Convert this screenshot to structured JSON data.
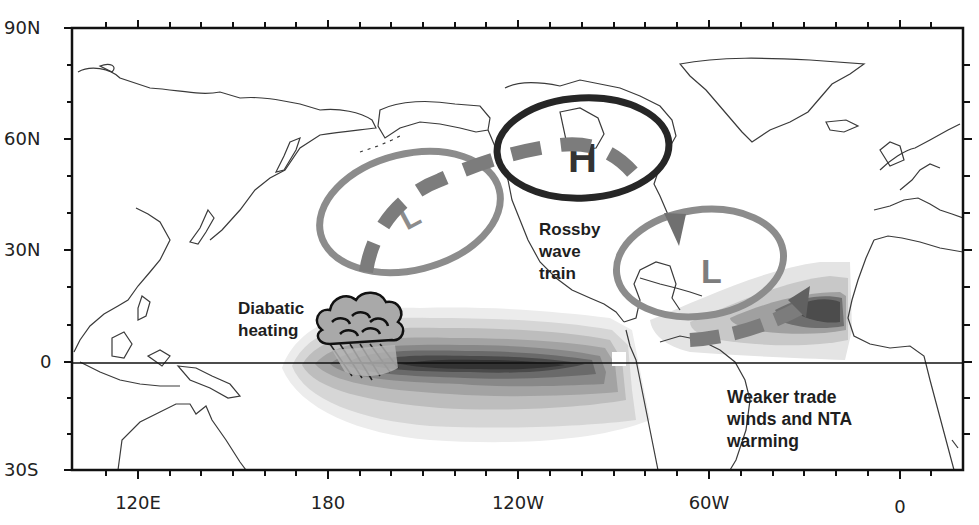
{
  "figure": {
    "type": "schematic map",
    "projection": "cylindrical equidistant",
    "lon_range": [
      "100E",
      "20E (via dateline)"
    ],
    "lat_range": [
      "30S",
      "90N"
    ]
  },
  "axes": {
    "y_ticks": [
      {
        "label": "90N",
        "y": 28
      },
      {
        "label": "60N",
        "y": 139
      },
      {
        "label": "30N",
        "y": 250
      },
      {
        "label": "0",
        "y": 362
      },
      {
        "label": "30S",
        "y": 470
      }
    ],
    "x_ticks": [
      {
        "label": "120E",
        "x": 138
      },
      {
        "label": "180",
        "x": 328
      },
      {
        "label": "120W",
        "x": 518
      },
      {
        "label": "60W",
        "x": 709
      },
      {
        "label": "0",
        "x": 900
      }
    ]
  },
  "annotations": {
    "diabatic": {
      "line1": "Diabatic",
      "line2": "heating"
    },
    "rossby": {
      "line1": "Rossby",
      "line2": "wave",
      "line3": "train"
    },
    "trade": {
      "line1": "Weaker trade",
      "line2": "winds and NTA",
      "line3": "warming"
    }
  },
  "pressure_centers": [
    {
      "label": "L",
      "location": "North Pacific",
      "ring_color": "#8a8a8a"
    },
    {
      "label": "H",
      "location": "Northern Canada",
      "ring_color": "#2a2a2a"
    },
    {
      "label": "L",
      "location": "Western North Atlantic",
      "ring_color": "#8a8a8a"
    }
  ],
  "colors": {
    "frame": "#111111",
    "coast": "#3a3a3a",
    "low_ring": "#8c8c8c",
    "high_ring": "#262626",
    "arrow": "#7a7a7a",
    "shade_levels": [
      "#ececec",
      "#d6d6d6",
      "#bdbdbd",
      "#a3a3a3",
      "#888888",
      "#6a6a6a",
      "#4a4a4a",
      "#333333"
    ]
  }
}
